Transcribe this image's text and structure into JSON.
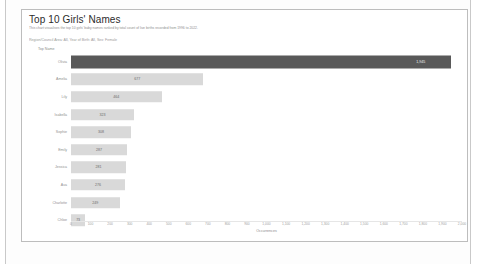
{
  "report": {
    "title": "Top 10 Girls' Names",
    "subtitle": "This chart visualises the top 10 girls' baby names ranked by total count of live births recorded from 1996 to 2022.",
    "filter_line": "Region/Council Area: All, Year of Birth: All, Sex: Female"
  },
  "chart_data": {
    "type": "bar",
    "orientation": "horizontal",
    "title": "Top 10 Girls' Names",
    "categories": [
      "Olivia",
      "Amelia",
      "Lily",
      "Isabella",
      "Sophie",
      "Emily",
      "Jessica",
      "Ava",
      "Charlotte",
      "Chloe"
    ],
    "values": [
      1945,
      677,
      464,
      323,
      308,
      287,
      281,
      276,
      249,
      73
    ],
    "value_labels": [
      "1,945",
      "677",
      "464",
      "323",
      "308",
      "287",
      "281",
      "276",
      "249",
      "73"
    ],
    "highlight_index": 0,
    "colors": {
      "highlight_bar": "#595959",
      "default_bar": "#d9d9d9",
      "card_border": "#bdbdbd",
      "axis_text": "#a0a0a0"
    },
    "xlabel": "Occurrences",
    "ylabel": "Top Name",
    "xlim": [
      0,
      2000
    ],
    "xtick_step": 100,
    "xticks": [
      "0",
      "100",
      "200",
      "300",
      "400",
      "500",
      "600",
      "700",
      "800",
      "900",
      "1,000",
      "1,100",
      "1,200",
      "1,300",
      "1,400",
      "1,500",
      "1,600",
      "1,700",
      "1,800",
      "1,900",
      "2,000"
    ],
    "grid": false,
    "legend": "none"
  }
}
